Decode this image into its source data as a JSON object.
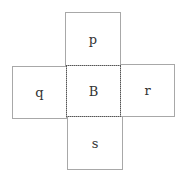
{
  "diagram": {
    "type": "cube-net",
    "center": {
      "label": "B",
      "border": "dotted"
    },
    "faces": {
      "top": {
        "label": "p"
      },
      "left": {
        "label": "q"
      },
      "right": {
        "label": "r"
      },
      "bottom": {
        "label": "s"
      }
    },
    "colors": {
      "line": "#a8a8a8",
      "dotted_line": "#555555",
      "text": "#333333",
      "background": "#ffffff"
    }
  }
}
